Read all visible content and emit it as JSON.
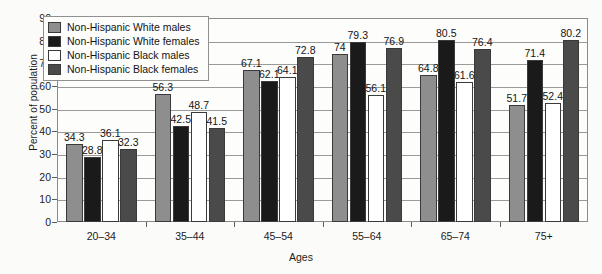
{
  "chart_data": {
    "type": "bar",
    "title": "",
    "xlabel": "Ages",
    "ylabel": "Percent of population",
    "ylim": [
      0,
      90
    ],
    "ytick_step": 10,
    "yticks": [
      0,
      10,
      20,
      30,
      40,
      50,
      60,
      70,
      80,
      90
    ],
    "grid": true,
    "legend_position": "top-left",
    "categories": [
      "20–34",
      "35–44",
      "45–54",
      "55–64",
      "65–74",
      "75+"
    ],
    "series": [
      {
        "name": "Non-Hispanic White males",
        "color": "#8e8e8e",
        "values": [
          34.3,
          56.3,
          67.1,
          74,
          64.8,
          51.7
        ],
        "labels": [
          "34.3",
          "56.3",
          "67.1",
          "74",
          "64.8",
          "51.7"
        ]
      },
      {
        "name": "Non-Hispanic White females",
        "color": "#1a1a1a",
        "values": [
          28.8,
          42.5,
          62.1,
          79.3,
          80.5,
          71.4
        ],
        "labels": [
          "28.8",
          "42.5",
          "62.1",
          "79.3",
          "80.5",
          "71.4"
        ]
      },
      {
        "name": "Non-Hispanic Black males",
        "color": "#ffffff",
        "values": [
          36.1,
          48.7,
          64.1,
          56.1,
          61.6,
          52.4
        ],
        "labels": [
          "36.1",
          "48.7",
          "64.1",
          "56.1",
          "61.6",
          "52.4"
        ]
      },
      {
        "name": "Non-Hispanic Black females",
        "color": "#4a4a4a",
        "values": [
          32.3,
          41.5,
          72.8,
          76.9,
          76.4,
          80.2
        ],
        "labels": [
          "32.3",
          "41.5",
          "72.8",
          "76.9",
          "76.4",
          "80.2"
        ]
      }
    ]
  }
}
